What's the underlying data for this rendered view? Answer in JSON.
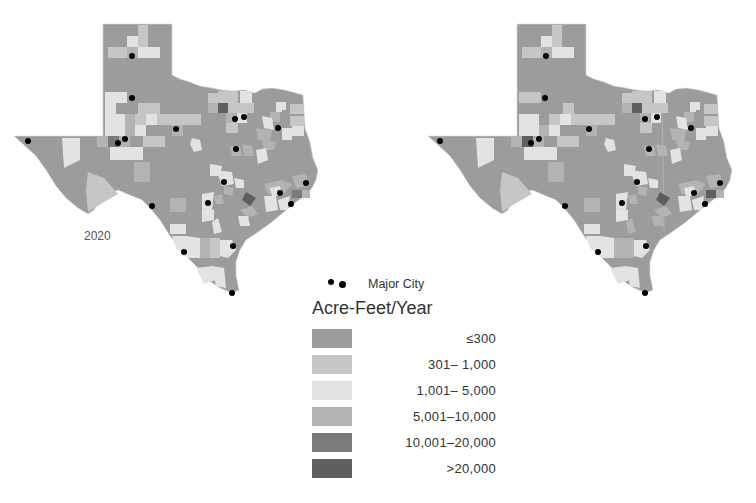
{
  "maps": [
    {
      "year_label": "2020"
    },
    {
      "year_label": "2040"
    }
  ],
  "legend": {
    "city_label": "Major City",
    "title": "Acre-Feet/Year",
    "classes": [
      {
        "range": "≤300",
        "color": "#9c9c9c"
      },
      {
        "range": "301–  1,000",
        "color": "#c6c6c6"
      },
      {
        "range": "1,001–  5,000",
        "color": "#e3e3e3"
      },
      {
        "range": "5,001–10,000",
        "color": "#b3b3b3"
      },
      {
        "range": "10,001–20,000",
        "color": "#7b7b7b"
      },
      {
        "range": ">20,000",
        "color": "#5f5f5f"
      }
    ]
  },
  "colors": {
    "base": "#9c9c9c",
    "light": "#c6c6c6",
    "lightest": "#e3e3e3",
    "mid": "#b3b3b3",
    "dark": "#7b7b7b",
    "darkest": "#5f5f5f",
    "city": "#000000",
    "border": "#ffffff"
  },
  "cities_2020": [
    [
      132,
      56
    ],
    [
      132,
      98
    ],
    [
      176,
      129
    ],
    [
      235,
      119
    ],
    [
      244,
      117
    ],
    [
      278,
      128
    ],
    [
      125,
      139
    ],
    [
      118,
      143
    ],
    [
      28,
      141
    ],
    [
      236,
      149
    ],
    [
      224,
      182
    ],
    [
      208,
      203
    ],
    [
      152,
      206
    ],
    [
      306,
      183
    ],
    [
      280,
      193
    ],
    [
      291,
      204
    ],
    [
      184,
      252
    ],
    [
      233,
      246
    ],
    [
      232,
      293
    ],
    [
      331,
      282
    ]
  ],
  "cities_2040": [
    [
      130,
      56
    ],
    [
      129,
      98
    ],
    [
      173,
      129
    ],
    [
      229,
      119
    ],
    [
      241,
      117
    ],
    [
      275,
      128
    ],
    [
      123,
      139
    ],
    [
      115,
      143
    ],
    [
      24,
      141
    ],
    [
      233,
      149
    ],
    [
      221,
      182
    ],
    [
      206,
      203
    ],
    [
      149,
      206
    ],
    [
      304,
      183
    ],
    [
      278,
      193
    ],
    [
      289,
      204
    ],
    [
      182,
      252
    ],
    [
      230,
      246
    ],
    [
      229,
      293
    ]
  ]
}
